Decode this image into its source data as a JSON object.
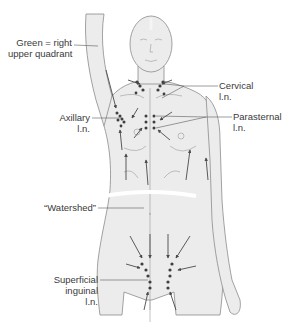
{
  "figure": {
    "colors": {
      "skin_fill": "#ececec",
      "outline": "#8c8c8c",
      "arrow": "#4a4a4a",
      "node": "#3f3f3f",
      "leader": "#5a5a5a",
      "text": "#3a3a3a",
      "watershed": "#ffffff"
    }
  },
  "labels": {
    "green": {
      "line1": "Green = right",
      "line2": "upper quadrant"
    },
    "cervical": {
      "line1": "Cervical",
      "line2": "l.n."
    },
    "axillary": {
      "line1": "Axillary",
      "line2": "l.n."
    },
    "parasternal": {
      "line1": "Parasternal",
      "line2": "l.n."
    },
    "watershed": {
      "line1": "“Watershed”"
    },
    "inguinal": {
      "line1": "Superficial",
      "line2": "inguinal",
      "line3": "l.n."
    }
  }
}
